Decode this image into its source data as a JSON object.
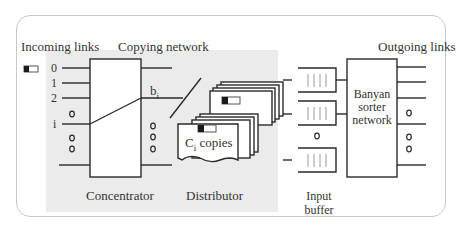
{
  "labels": {
    "incoming_links": "Incoming links",
    "copying_network": "Copying network",
    "outgoing_links": "Outgoing links",
    "concentrator": "Concentrator",
    "distributor": "Distributor",
    "input_buffer_line1": "Input",
    "input_buffer_line2": "buffer",
    "banyan_line1": "Banyan",
    "banyan_line2": "sorter",
    "banyan_line3": "network",
    "b_i_base": "b",
    "b_i_sub": "i",
    "ci_base": "C",
    "ci_sub": "i",
    "ci_rest": " copies"
  },
  "input_indices": [
    "0",
    "1",
    "2",
    "i"
  ],
  "colors": {
    "line": "#2a2a2a",
    "grey_area": "#ebebeb",
    "frame": "#c8c8c8",
    "buffer_tick": "#9a9a9a",
    "packet_fill": "#1a1a1a"
  }
}
